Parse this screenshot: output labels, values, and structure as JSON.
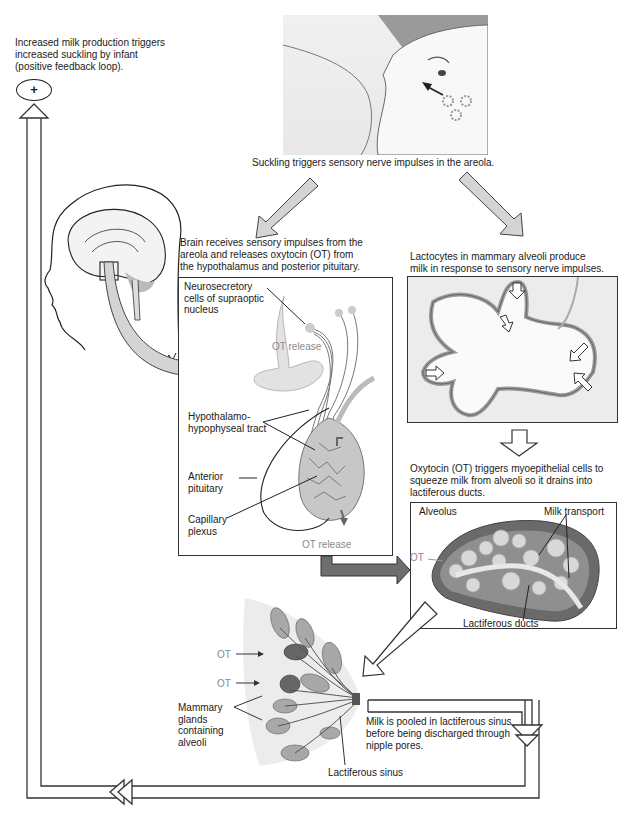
{
  "feedback": {
    "caption": [
      "Increased milk production triggers",
      "increased suckling by infant",
      "(positive feedback loop)."
    ],
    "symbol": "+"
  },
  "suckling": {
    "caption": "Suckling triggers sensory nerve impulses in the areola."
  },
  "brain_step": {
    "caption": [
      "Brain receives sensory impulses from the",
      "areola and releases oxytocin (OT) from",
      "the hypothalamus and posterior pituitary."
    ],
    "labels": {
      "neurosecretory": [
        "Neurosecretory",
        "cells of supraoptic",
        "nucleus"
      ],
      "ot_release_top": "OT release",
      "tract": [
        "Hypothalamo-",
        "hypophyseal tract"
      ],
      "anterior": [
        "Anterior",
        "pituitary"
      ],
      "capillary": [
        "Capillary",
        "plexus"
      ],
      "ot_release_bottom": "OT release"
    }
  },
  "lactocyte_step": {
    "caption": [
      "Lactocytes in mammary alveoli produce",
      "milk in response to sensory nerve impulses."
    ]
  },
  "oxytocin_step": {
    "caption": [
      "Oxytocin (OT) triggers myoepithelial cells to",
      "squeeze milk from alveoli so it drains into",
      "lactiferous ducts."
    ],
    "labels": {
      "alveolus": "Alveolus",
      "milk_transport": "Milk transport",
      "ot": "OT",
      "ducts": "Lactiferous ducts"
    }
  },
  "breast": {
    "labels": {
      "ot1": "OT",
      "ot2": "OT",
      "glands": [
        "Mammary",
        "glands",
        "containing",
        "alveoli"
      ],
      "sinus": "Lactiferous sinus"
    }
  },
  "pooling": {
    "caption": [
      "Milk is pooled in lactiferous sinus",
      "before being discharged through",
      "nipple pores."
    ]
  },
  "colors": {
    "arrow_fill": "#d4d4d4",
    "arrow_dark": "#6e6e6e",
    "outline": "#333333",
    "tissue": "#cfcfcf",
    "tissue_dark": "#8c8c8c"
  }
}
